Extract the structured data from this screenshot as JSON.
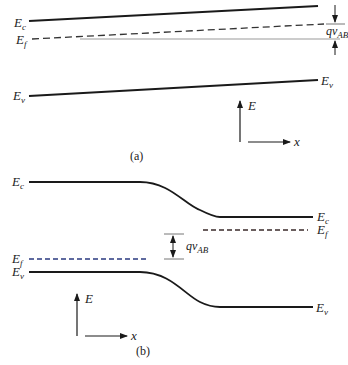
{
  "panel_a": {
    "caption": "(a)",
    "labels": {
      "ec_left": {
        "main": "E",
        "sub": "c"
      },
      "ef_left": {
        "main": "E",
        "sub": "f"
      },
      "ev_left": {
        "main": "E",
        "sub": "v"
      },
      "ev_right": {
        "main": "E",
        "sub": "v"
      },
      "qv": {
        "main": "qv",
        "sub": "AB"
      }
    },
    "axes": {
      "y_label": "E",
      "x_label": "x"
    }
  },
  "panel_b": {
    "caption": "(b)",
    "labels": {
      "ec_left": {
        "main": "E",
        "sub": "c"
      },
      "ef_left": {
        "main": "E",
        "sub": "f"
      },
      "ev_left": {
        "main": "E",
        "sub": "v"
      },
      "ec_right": {
        "main": "E",
        "sub": "c"
      },
      "ef_right": {
        "main": "E",
        "sub": "f"
      },
      "ev_right": {
        "main": "E",
        "sub": "v"
      },
      "qv": {
        "main": "qv",
        "sub": "AB"
      }
    },
    "axes": {
      "y_label": "E",
      "x_label": "x"
    }
  },
  "colors": {
    "line": "#1a1a1a",
    "dashed_left": "#2a3a80",
    "dashed_right": "#3a2a2a",
    "reference_line": "#9a9a9a"
  }
}
